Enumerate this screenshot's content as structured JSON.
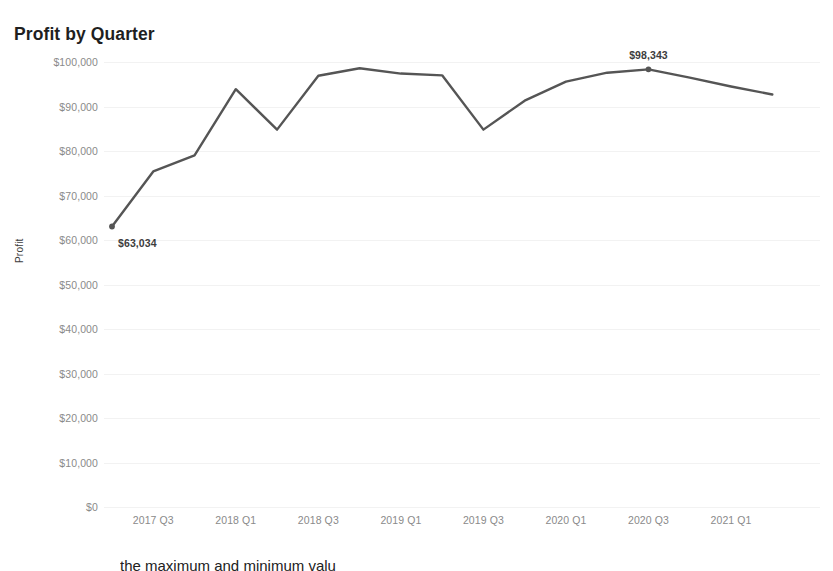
{
  "chart_data": {
    "type": "line",
    "title": "Profit by Quarter",
    "xlabel": "",
    "ylabel": "Profit",
    "ylim": [
      0,
      100000
    ],
    "grid": true,
    "legend": null,
    "line_color": "#555555",
    "categories": [
      "2017 Q2",
      "2017 Q3",
      "2017 Q4",
      "2018 Q1",
      "2018 Q2",
      "2018 Q3",
      "2018 Q4",
      "2019 Q1",
      "2019 Q2",
      "2019 Q3",
      "2019 Q4",
      "2020 Q1",
      "2020 Q2",
      "2020 Q3",
      "2020 Q4",
      "2021 Q1",
      "2021 Q2"
    ],
    "values": [
      63034,
      75400,
      79000,
      93900,
      84800,
      96900,
      98600,
      97400,
      97000,
      84800,
      91300,
      95600,
      97600,
      98343,
      96500,
      94500,
      92700
    ],
    "x_tick_labels": [
      "2017 Q3",
      "2018 Q1",
      "2018 Q3",
      "2019 Q1",
      "2019 Q3",
      "2020 Q1",
      "2020 Q3",
      "2021 Q1"
    ],
    "x_tick_categories": [
      "2017 Q3",
      "2018 Q1",
      "2018 Q3",
      "2019 Q1",
      "2019 Q3",
      "2020 Q1",
      "2020 Q3",
      "2021 Q1"
    ],
    "y_tick_labels": [
      "$100,000",
      "$90,000",
      "$80,000",
      "$70,000",
      "$60,000",
      "$50,000",
      "$40,000",
      "$30,000",
      "$20,000",
      "$10,000",
      "$0"
    ],
    "y_tick_values": [
      100000,
      90000,
      80000,
      70000,
      60000,
      50000,
      40000,
      30000,
      20000,
      10000,
      0
    ],
    "annotations": [
      {
        "name": "min",
        "label": "$63,034",
        "category": "2017 Q2",
        "value": 63034
      },
      {
        "name": "max",
        "label": "$98,343",
        "category": "2020 Q3",
        "value": 98343
      }
    ]
  },
  "caption": {
    "text": "the maximum and minimum valu"
  }
}
